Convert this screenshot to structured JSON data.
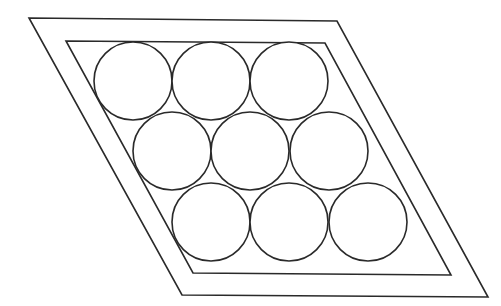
{
  "diagram": {
    "stroke_color": "#2a2a2a",
    "background_color": "#ffffff",
    "outer_parallelogram": {
      "points": [
        [
          29,
          18
        ],
        [
          337,
          21
        ],
        [
          488,
          297
        ],
        [
          182,
          295
        ]
      ]
    },
    "inner_parallelogram": {
      "points": [
        [
          66,
          41
        ],
        [
          325,
          43
        ],
        [
          451,
          275
        ],
        [
          193,
          273
        ]
      ]
    },
    "circle_radius": 39,
    "rows": [
      {
        "label": "top",
        "circles": [
          [
            133,
            81
          ],
          [
            211,
            81
          ],
          [
            289,
            81
          ]
        ]
      },
      {
        "label": "middle",
        "circles": [
          [
            172,
            151
          ],
          [
            250,
            151
          ],
          [
            329,
            151
          ]
        ]
      },
      {
        "label": "bottom",
        "circles": [
          [
            211,
            222
          ],
          [
            289,
            222
          ],
          [
            368,
            222
          ]
        ]
      }
    ],
    "circle_count": 9
  }
}
